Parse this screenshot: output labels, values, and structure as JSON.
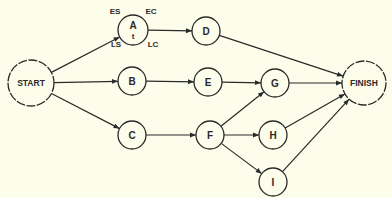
{
  "diagram": {
    "type": "pert-network",
    "background": "#fdfdec",
    "ink": "#2a2a2a",
    "nodes": [
      {
        "id": "START",
        "label": "START",
        "x": 31,
        "y": 83,
        "r": 23,
        "style": "dashed"
      },
      {
        "id": "A",
        "label": "A",
        "sub": "t",
        "x": 133,
        "y": 30,
        "r": 15
      },
      {
        "id": "B",
        "label": "B",
        "x": 132,
        "y": 81,
        "r": 14
      },
      {
        "id": "C",
        "label": "C",
        "x": 132,
        "y": 135,
        "r": 14
      },
      {
        "id": "D",
        "label": "D",
        "x": 206,
        "y": 31,
        "r": 14
      },
      {
        "id": "E",
        "label": "E",
        "x": 208,
        "y": 82,
        "r": 14
      },
      {
        "id": "F",
        "label": "F",
        "x": 210,
        "y": 135,
        "r": 14
      },
      {
        "id": "G",
        "label": "G",
        "x": 275,
        "y": 83,
        "r": 14
      },
      {
        "id": "H",
        "label": "H",
        "x": 273,
        "y": 135,
        "r": 14
      },
      {
        "id": "I",
        "label": "I",
        "x": 273,
        "y": 182,
        "r": 14
      },
      {
        "id": "FINISH",
        "label": "FINISH",
        "x": 364,
        "y": 83,
        "r": 22,
        "style": "dashed"
      }
    ],
    "edges": [
      [
        "START",
        "A"
      ],
      [
        "START",
        "B"
      ],
      [
        "START",
        "C"
      ],
      [
        "A",
        "D"
      ],
      [
        "B",
        "E"
      ],
      [
        "C",
        "F"
      ],
      [
        "D",
        "FINISH"
      ],
      [
        "E",
        "G"
      ],
      [
        "F",
        "G"
      ],
      [
        "F",
        "H"
      ],
      [
        "F",
        "I"
      ],
      [
        "G",
        "FINISH"
      ],
      [
        "H",
        "FINISH"
      ],
      [
        "I",
        "FINISH"
      ]
    ],
    "corner_labels": {
      "es": {
        "text": "ES",
        "x": 115,
        "y": 14
      },
      "ec": {
        "text": "EC",
        "x": 151,
        "y": 14
      },
      "ls": {
        "text": "LS",
        "x": 116,
        "y": 47
      },
      "lc": {
        "text": "LC",
        "x": 153,
        "y": 47
      }
    }
  }
}
